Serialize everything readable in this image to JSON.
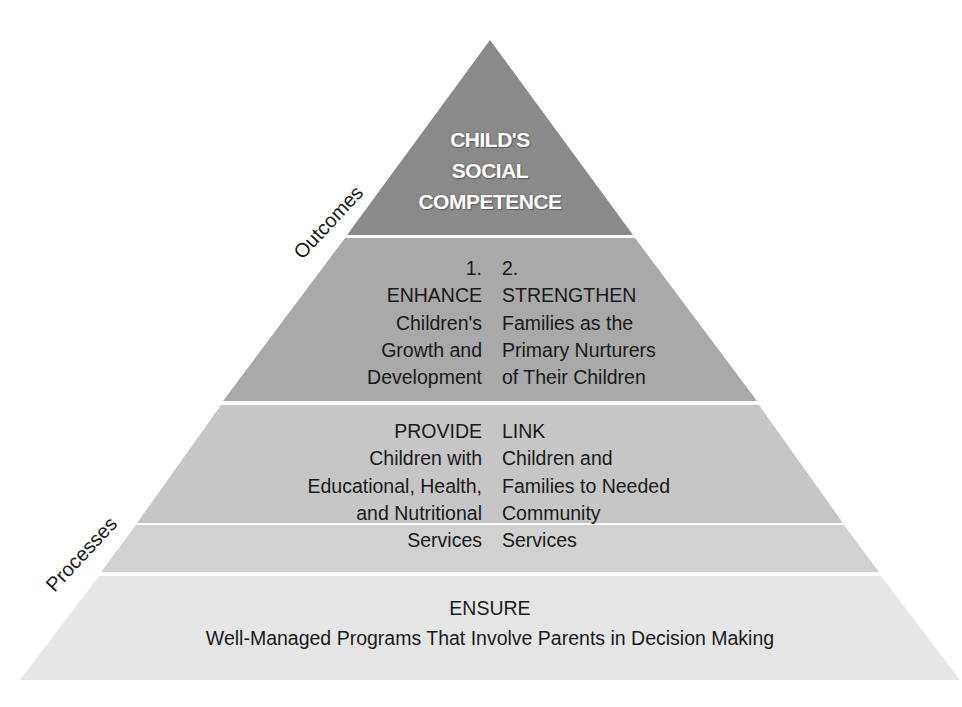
{
  "diagram": {
    "type": "pyramid",
    "colors": {
      "tier_apex": "#8a8a8a",
      "tier_outcomes": "#a9a9a9",
      "tier_processes_upper": "#c6c6c6",
      "tier_processes_lower": "#d1d1d1",
      "tier_base": "#e6e6e6",
      "separator": "#ffffff"
    },
    "side_labels": {
      "outcomes": "Outcomes",
      "processes": "Processes"
    },
    "apex": {
      "lines": [
        "CHILD'S",
        "SOCIAL",
        "COMPETENCE"
      ]
    },
    "tier2": {
      "left": {
        "number": "1.",
        "heading": "ENHANCE",
        "lines": [
          "Children's",
          "Growth and",
          "Development"
        ]
      },
      "right": {
        "number": "2.",
        "heading": "STRENGTHEN",
        "lines": [
          "Families as the",
          "Primary Nurturers",
          "of Their Children"
        ]
      }
    },
    "tier3": {
      "left": {
        "heading": "PROVIDE",
        "lines": [
          "Children with",
          "Educational, Health,",
          "and Nutritional",
          "Services"
        ]
      },
      "right": {
        "heading": "LINK",
        "lines": [
          "Children and",
          "Families to Needed",
          "Community",
          "Services"
        ]
      }
    },
    "base": {
      "heading": "ENSURE",
      "subtitle": "Well-Managed Programs That Involve Parents in Decision Making"
    }
  }
}
